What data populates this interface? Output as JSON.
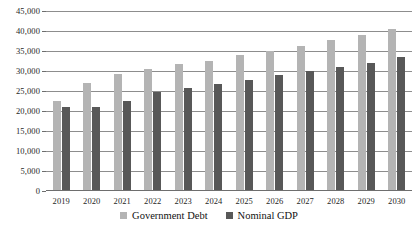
{
  "chart_data": {
    "type": "bar",
    "title": "",
    "subtitle": "",
    "xlabel": "",
    "ylabel": "",
    "ylim": [
      0,
      45000
    ],
    "ytick_step": 5000,
    "yticks": [
      0,
      5000,
      10000,
      15000,
      20000,
      25000,
      30000,
      35000,
      40000,
      45000
    ],
    "ytick_labels": [
      "0",
      "5,000",
      "10,000",
      "15,000",
      "20,000",
      "25,000",
      "30,000",
      "35,000",
      "40,000",
      "45,000"
    ],
    "grid": true,
    "grid_axis": "y",
    "legend_position": "bottom-center",
    "categories": [
      "2019",
      "2020",
      "2021",
      "2022",
      "2023",
      "2024",
      "2025",
      "2026",
      "2027",
      "2028",
      "2029",
      "2030"
    ],
    "series": [
      {
        "name": "Government Debt",
        "color": "#b4b4b4",
        "values": [
          22400,
          26900,
          29200,
          30600,
          31700,
          32500,
          34000,
          35000,
          36200,
          37800,
          39000,
          40400
        ]
      },
      {
        "name": "Nominal GDP",
        "color": "#585858",
        "values": [
          21000,
          21000,
          22600,
          24700,
          25800,
          26700,
          27700,
          28900,
          30000,
          31000,
          32100,
          33400
        ]
      }
    ]
  },
  "legend": {
    "items": [
      {
        "label": "Government Debt",
        "swatch": "legend-swatch-debt"
      },
      {
        "label": "Nominal GDP",
        "swatch": "legend-swatch-gdp"
      }
    ]
  },
  "colors": {
    "series_government_debt": "#b4b4b4",
    "series_nominal_gdp": "#585858",
    "gridline": "#8d8d8d",
    "axis": "#6e6e6e",
    "text": "#1f1f1f",
    "background": "#ffffff"
  }
}
